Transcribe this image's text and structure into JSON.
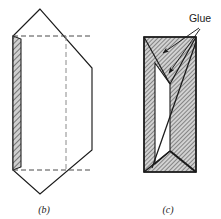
{
  "figure": {
    "name": "prism-net-and-assembled-prism",
    "background_color": "#ffffff",
    "line_color": "#1a1a1a",
    "hatch_color": "#6e6e6e",
    "hatch_fill": "#c9c9c9",
    "width": 221,
    "height": 219
  },
  "annotations": {
    "glue_label": "Glue",
    "caption_b": "(b)",
    "caption_c": "(c)"
  },
  "panel_b": {
    "name": "flat-pattern-panel",
    "description": "unfolded flat pattern with hatched glue strip and dashed fold lines",
    "outline_points": "40,9 13,36 13,170 40,194 92,150 92,68",
    "hatch_strip_points": "13,36 21,39 21,167 13,170",
    "fold_dashed_top": "13,36 92,36",
    "fold_dashed_bottom": "13,170 92,170",
    "fold_dashed_vertical": "66,36 66,170",
    "caption_x": 44,
    "caption_y": 213
  },
  "panel_c": {
    "name": "assembled-prism-panel",
    "description": "assembled triangular prism viewed end-on with glued seams",
    "outer_points": "144,37 196,37 196,172 144,172",
    "inner_void_points": "155,63 170,84 170,151 155,164",
    "top_fold_left": "144,37 170,84",
    "top_fold_right": "170,84 196,37",
    "bottom_fold_left": "144,172 170,151",
    "bottom_fold_right": "170,151 196,172",
    "seam_diagonal": "196,42 152,168",
    "caption_x": 168,
    "caption_y": 213
  },
  "glue_leaders": {
    "name": "glue-leader-lines",
    "origin": "199,28",
    "leader_1_end": "161,54",
    "leader_2_end": "168,74",
    "label_x": 200,
    "label_y": 22
  }
}
